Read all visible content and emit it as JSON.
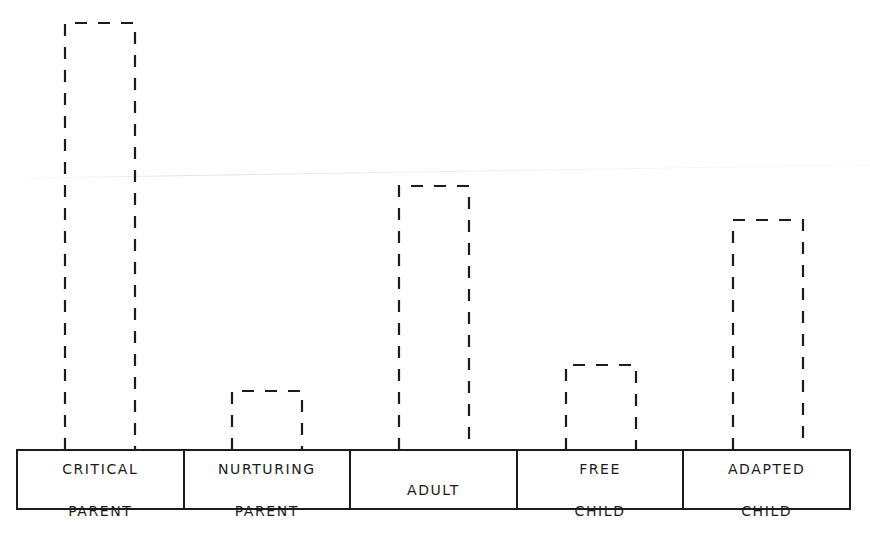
{
  "chart_data": {
    "type": "bar",
    "title": "",
    "xlabel": "",
    "ylabel": "",
    "categories": [
      "CRITICAL PARENT",
      "NURTURING PARENT",
      "ADULT",
      "FREE CHILD",
      "ADAPTED CHILD"
    ],
    "values": [
      100,
      14,
      62,
      20,
      54
    ],
    "value_note": "Relative bar heights (tallest = 100); no numeric axis shown",
    "ylim": [
      0,
      100
    ],
    "grid": false,
    "legend": null,
    "style": "dashed outline bars"
  },
  "axis": {
    "labels": [
      {
        "line1": "CRITICAL",
        "line2": "PARENT"
      },
      {
        "line1": "NURTURING",
        "line2": "PARENT"
      },
      {
        "line1": "ADULT",
        "line2": ""
      },
      {
        "line1": "FREE",
        "line2": "CHILD"
      },
      {
        "line1": "ADAPTED",
        "line2": "CHILD"
      }
    ]
  },
  "colors": {
    "ink": "#1c1c1c",
    "background": "#ffffff"
  }
}
